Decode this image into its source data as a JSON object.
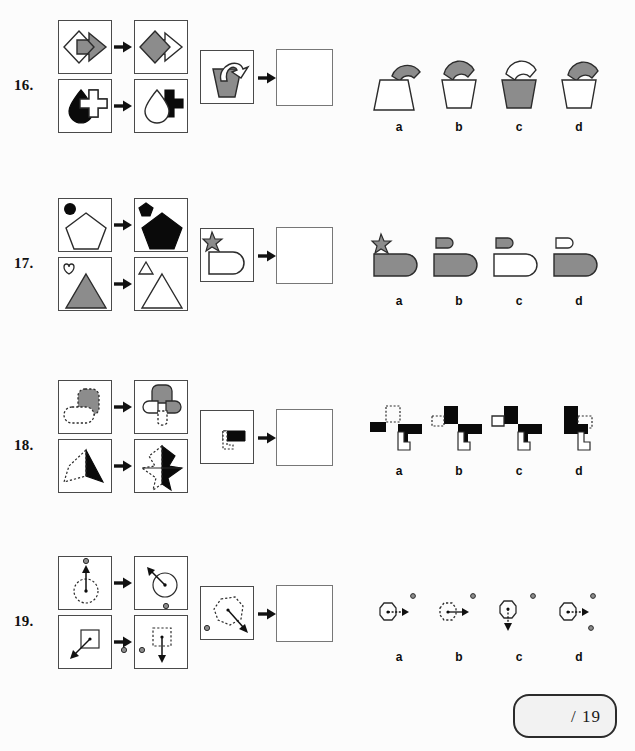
{
  "page": {
    "background_color": "#fcfcfc",
    "fill_gray": "#8c8c8c",
    "fill_black": "#0a0a0a",
    "fill_white": "#ffffff",
    "stroke_color": "#2b2b2b",
    "box_border_color": "#4a4a4a"
  },
  "score_box": {
    "name": "score-field",
    "text": "/ 19"
  },
  "questions": [
    {
      "number": "16.",
      "top": 20,
      "matrix": {
        "row1": {
          "left_cell": "outlined-diamond-with-gray-right-arrow",
          "right_cell": "gray-diamond-with-white-right-arrow"
        },
        "row2": {
          "left_cell": "black-droplet-with-white-cross",
          "right_cell": "white-droplet-with-black-cross"
        }
      },
      "problem_cell": "gray-cup-with-white-hook",
      "answer_cell": "empty-answer-box",
      "options": [
        {
          "label": "a",
          "desc": "gray-hook-on-white-wide-trapezoid-cup"
        },
        {
          "label": "b",
          "desc": "gray-hook-on-white-narrow-cup"
        },
        {
          "label": "c",
          "desc": "white-hook-on-gray-cup"
        },
        {
          "label": "d",
          "desc": "gray-hook-inside-white-cup"
        }
      ]
    },
    {
      "number": "17.",
      "top": 198,
      "matrix": {
        "row1": {
          "left_cell": "black-circle-with-white-pentagon",
          "right_cell": "black-pentagon-small-and-black-pentagon-large"
        },
        "row2": {
          "left_cell": "white-heart-with-gray-triangle",
          "right_cell": "white-triangle-small-and-white-triangle-large"
        }
      },
      "problem_cell": "gray-star-with-white-rounded-rectangle",
      "answer_cell": "empty-answer-box",
      "options": [
        {
          "label": "a",
          "desc": "gray-star-above-gray-rounded-rectangle"
        },
        {
          "label": "b",
          "desc": "small-gray-rounded-rect-above-gray-rounded-rect"
        },
        {
          "label": "c",
          "desc": "small-gray-rounded-rect-above-white-rounded-rect"
        },
        {
          "label": "d",
          "desc": "small-white-rounded-rect-above-gray-rounded-rect"
        }
      ]
    },
    {
      "number": "18.",
      "top": 380,
      "matrix": {
        "row1": {
          "left_cell": "dotted-outline-lobe-with-gray-lobe",
          "right_cell": "four-lobe-cross-gray-and-dotted"
        },
        "row2": {
          "left_cell": "dotted-outline-spike-with-black-spike",
          "right_cell": "mirrored-spike-black-and-outline"
        }
      },
      "problem_cell": "black-blocky-shape-with-dotted-outline",
      "answer_cell": "empty-answer-box",
      "options": [
        {
          "label": "a",
          "desc": "blocky-mirror-with-dotted-top-left"
        },
        {
          "label": "b",
          "desc": "blocky-mirror-with-dotted-left"
        },
        {
          "label": "c",
          "desc": "blocky-mirror-all-solid"
        },
        {
          "label": "d",
          "desc": "blocky-mirror-with-dotted-right"
        }
      ]
    },
    {
      "number": "19.",
      "top": 556,
      "matrix": {
        "row1": {
          "left_cell": "dotted-circle-with-up-arrow-and-dot-above",
          "right_cell": "circle-with-up-left-arrow-and-dot-below"
        },
        "row2": {
          "left_cell": "square-with-down-left-arrow-dot-right",
          "right_cell": "dotted-square-with-down-arrow-dot-left"
        }
      },
      "problem_cell": "dotted-octagon-with-down-right-arrow-dot-left",
      "answer_cell": "empty-answer-box",
      "options": [
        {
          "label": "a",
          "desc": "solid-octagon-right-arrow-dot-upper-right"
        },
        {
          "label": "b",
          "desc": "dotted-octagon-right-arrow-dot-upper-right"
        },
        {
          "label": "c",
          "desc": "solid-octagon-down-arrow-dot-upper-right"
        },
        {
          "label": "d",
          "desc": "solid-octagon-right-arrow-dots-upper-and-lower-right"
        }
      ]
    }
  ]
}
